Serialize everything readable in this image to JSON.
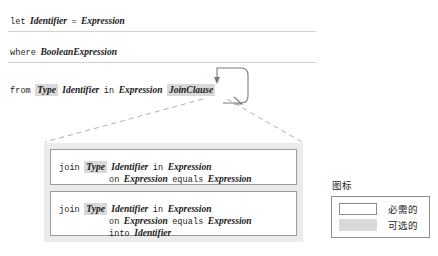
{
  "clauses": [
    {
      "id": "let-clause",
      "tokens": [
        {
          "text": "let",
          "style": "kw"
        },
        {
          "text": "Identifier",
          "style": "ph"
        },
        {
          "text": "=",
          "style": "op"
        },
        {
          "text": "Expression",
          "style": "ph"
        }
      ]
    },
    {
      "id": "where-clause",
      "tokens": [
        {
          "text": "where",
          "style": "kw"
        },
        {
          "text": "BooleanExpression",
          "style": "ph"
        }
      ]
    },
    {
      "id": "from-clause",
      "tokens": [
        {
          "text": "from",
          "style": "kw"
        },
        {
          "text": "Type",
          "style": "ph",
          "optional": true
        },
        {
          "text": "Identifier",
          "style": "ph"
        },
        {
          "text": "in",
          "style": "kw"
        },
        {
          "text": "Expression",
          "style": "ph"
        },
        {
          "text": "JoinClause",
          "style": "ph",
          "optional": true
        }
      ]
    }
  ],
  "clause_text": {
    "let": "let Identifier = Expression",
    "where": "where BooleanExpression",
    "from": "from Type Identifier in Expression JoinClause"
  },
  "expansion": {
    "boxes": [
      {
        "id": "join-simple",
        "lines": [
          {
            "indent": false,
            "tokens": [
              {
                "text": "join",
                "style": "kw"
              },
              {
                "text": "Type",
                "style": "ph",
                "optional": true
              },
              {
                "text": "Identifier",
                "style": "ph"
              },
              {
                "text": "in",
                "style": "kw"
              },
              {
                "text": "Expression",
                "style": "ph"
              }
            ]
          },
          {
            "indent": true,
            "tokens": [
              {
                "text": "on",
                "style": "kw"
              },
              {
                "text": "Expression",
                "style": "ph"
              },
              {
                "text": "equals",
                "style": "kw"
              },
              {
                "text": "Expression",
                "style": "ph"
              }
            ]
          }
        ]
      },
      {
        "id": "join-into",
        "lines": [
          {
            "indent": false,
            "tokens": [
              {
                "text": "join",
                "style": "kw"
              },
              {
                "text": "Type",
                "style": "ph",
                "optional": true
              },
              {
                "text": "Identifier",
                "style": "ph"
              },
              {
                "text": "in",
                "style": "kw"
              },
              {
                "text": "Expression",
                "style": "ph"
              }
            ]
          },
          {
            "indent": true,
            "tokens": [
              {
                "text": "on",
                "style": "kw"
              },
              {
                "text": "Expression",
                "style": "ph"
              },
              {
                "text": "equals",
                "style": "kw"
              },
              {
                "text": "Expression",
                "style": "ph"
              }
            ]
          },
          {
            "indent": true,
            "tokens": [
              {
                "text": "into",
                "style": "kw"
              },
              {
                "text": "Identifier",
                "style": "ph"
              }
            ]
          }
        ]
      }
    ],
    "box_text": {
      "join_simple": "join Type Identifier in Expression on Expression equals Expression",
      "join_into": "join Type Identifier in Expression on Expression equals Expression into Identifier"
    }
  },
  "legend": {
    "title": "图标",
    "required_label": "必需的",
    "optional_label": "可选的"
  },
  "colors": {
    "optional_fill": "#d9d9d9",
    "box_border": "#9b9b9b",
    "container_fill": "#ebebeb",
    "separator": "#d2d2d4",
    "arrow": "#7a7a7a",
    "dashed": "#b0b0b0",
    "text": "#1a1a1a"
  }
}
